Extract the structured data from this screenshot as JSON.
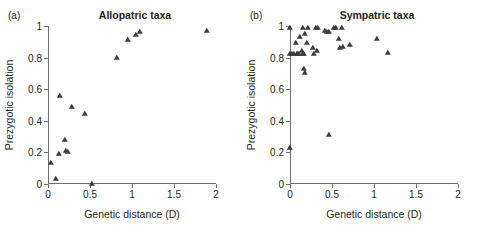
{
  "figure": {
    "background": "#ffffff",
    "marker_color": "#3b3b3d",
    "axis_color": "#6d6e71",
    "text_color": "#231f20"
  },
  "panels": [
    {
      "key": "a",
      "label": "(a)",
      "title": "Allopatric taxa"
    },
    {
      "key": "b",
      "label": "(b)",
      "title": "Sympatric taxa"
    }
  ],
  "axes": {
    "xlabel": "Genetic distance (D)",
    "ylabel": "Prezygotic isolation",
    "xlim": [
      0,
      2
    ],
    "ylim": [
      0,
      1
    ],
    "xticks": [
      0,
      0.5,
      1,
      1.5,
      2
    ],
    "xticklabels": [
      "0",
      "0.5",
      "1",
      "1.5",
      "2"
    ],
    "yticks": [
      0,
      0.2,
      0.4,
      0.6,
      0.8,
      1
    ],
    "yticklabels": [
      "0",
      "0.2",
      "0.4",
      "0.6",
      "0.8",
      "1"
    ],
    "grid": false
  },
  "chart_data": [
    {
      "type": "scatter",
      "title": "Allopatric taxa",
      "panel": "(a)",
      "xlabel": "Genetic distance (D)",
      "ylabel": "Prezygotic isolation",
      "xlim": [
        0,
        2
      ],
      "ylim": [
        0,
        1
      ],
      "xticks": [
        0,
        0.5,
        1,
        1.5,
        2
      ],
      "yticks": [
        0,
        0.2,
        0.4,
        0.6,
        0.8,
        1
      ],
      "grid": false,
      "legend": null,
      "marker": "triangle",
      "points": [
        {
          "x": 0.03,
          "y": 0.13
        },
        {
          "x": 0.1,
          "y": 0.03
        },
        {
          "x": 0.13,
          "y": 0.19
        },
        {
          "x": 0.14,
          "y": 0.56
        },
        {
          "x": 0.2,
          "y": 0.28
        },
        {
          "x": 0.21,
          "y": 0.21
        },
        {
          "x": 0.24,
          "y": 0.2
        },
        {
          "x": 0.29,
          "y": 0.49
        },
        {
          "x": 0.44,
          "y": 0.44
        },
        {
          "x": 0.52,
          "y": 0.0
        },
        {
          "x": 0.82,
          "y": 0.8
        },
        {
          "x": 0.95,
          "y": 0.91
        },
        {
          "x": 1.05,
          "y": 0.94
        },
        {
          "x": 1.1,
          "y": 0.96
        },
        {
          "x": 1.89,
          "y": 0.97
        }
      ]
    },
    {
      "type": "scatter",
      "title": "Sympatric taxa",
      "panel": "(b)",
      "xlabel": "Genetic distance (D)",
      "ylabel": "Prezygotic isolation",
      "xlim": [
        0,
        2
      ],
      "ylim": [
        0,
        1
      ],
      "xticks": [
        0,
        0.5,
        1,
        1.5,
        2
      ],
      "yticks": [
        0,
        0.2,
        0.4,
        0.6,
        0.8,
        1
      ],
      "grid": false,
      "legend": null,
      "marker": "triangle",
      "points": [
        {
          "x": 0.0,
          "y": 0.99
        },
        {
          "x": 0.0,
          "y": 0.82
        },
        {
          "x": 0.0,
          "y": 0.23
        },
        {
          "x": 0.02,
          "y": 0.82
        },
        {
          "x": 0.05,
          "y": 0.82
        },
        {
          "x": 0.07,
          "y": 0.89
        },
        {
          "x": 0.08,
          "y": 0.82
        },
        {
          "x": 0.09,
          "y": 0.82
        },
        {
          "x": 0.11,
          "y": 0.82
        },
        {
          "x": 0.12,
          "y": 0.93
        },
        {
          "x": 0.14,
          "y": 0.84
        },
        {
          "x": 0.15,
          "y": 0.99
        },
        {
          "x": 0.16,
          "y": 0.82
        },
        {
          "x": 0.17,
          "y": 0.73
        },
        {
          "x": 0.17,
          "y": 0.82
        },
        {
          "x": 0.18,
          "y": 0.95
        },
        {
          "x": 0.18,
          "y": 0.7
        },
        {
          "x": 0.2,
          "y": 0.89
        },
        {
          "x": 0.22,
          "y": 0.99
        },
        {
          "x": 0.27,
          "y": 0.86
        },
        {
          "x": 0.28,
          "y": 0.82
        },
        {
          "x": 0.31,
          "y": 0.99
        },
        {
          "x": 0.32,
          "y": 0.84
        },
        {
          "x": 0.33,
          "y": 0.99
        },
        {
          "x": 0.42,
          "y": 0.97
        },
        {
          "x": 0.44,
          "y": 0.96
        },
        {
          "x": 0.46,
          "y": 0.31
        },
        {
          "x": 0.47,
          "y": 0.96
        },
        {
          "x": 0.52,
          "y": 0.99
        },
        {
          "x": 0.55,
          "y": 0.99
        },
        {
          "x": 0.58,
          "y": 0.92
        },
        {
          "x": 0.6,
          "y": 0.86
        },
        {
          "x": 0.62,
          "y": 0.99
        },
        {
          "x": 0.63,
          "y": 0.87
        },
        {
          "x": 0.72,
          "y": 0.88
        },
        {
          "x": 1.04,
          "y": 0.92
        },
        {
          "x": 1.17,
          "y": 0.83
        }
      ]
    }
  ]
}
